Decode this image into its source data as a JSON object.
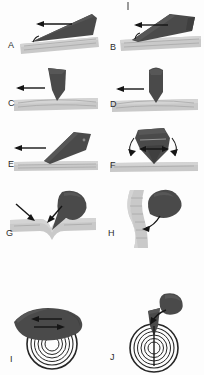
{
  "figure": {
    "background_color": "#fdfdfd",
    "tool_color": "#4a4a4a",
    "substrate_color": "#c9c9c9",
    "arrow_color": "#151515",
    "label_color": "#2b2b2b",
    "columns": 2,
    "rows": 5,
    "top_tick_mark": "I"
  },
  "panels": [
    {
      "label": "A",
      "row": 1,
      "column": 1,
      "tool_shape": "thin-elongated-wedge",
      "tool_orientation": "shallow-oblique",
      "substrate": "horizontal-striated-band",
      "arrow": {
        "type": "straight",
        "direction": "left",
        "count": 1
      },
      "contact": "tangential-edge-contact",
      "secondary_marker": "small-curved-tick-at-contact"
    },
    {
      "label": "B",
      "row": 1,
      "column": 2,
      "tool_shape": "broad-flat-blade",
      "tool_orientation": "shallow-oblique",
      "substrate": "horizontal-striated-band",
      "arrow": {
        "type": "straight",
        "direction": "left",
        "count": 1
      },
      "contact": "flat-face-contact",
      "secondary_marker": "small-curved-tick-at-contact"
    },
    {
      "label": "C",
      "row": 2,
      "column": 1,
      "tool_shape": "curved-leaf-blade",
      "tool_orientation": "near-vertical-tilted",
      "substrate": "horizontal-striated-band-with-furrow",
      "arrow": {
        "type": "straight",
        "direction": "left",
        "count": 1
      },
      "contact": "point-tip-contact",
      "secondary_marker": "none"
    },
    {
      "label": "D",
      "row": 2,
      "column": 2,
      "tool_shape": "rounded-tipped-column",
      "tool_orientation": "vertical",
      "substrate": "horizontal-striated-band-with-furrow",
      "arrow": {
        "type": "straight",
        "direction": "left",
        "count": 1
      },
      "contact": "point-tip-contact",
      "secondary_marker": "none"
    },
    {
      "label": "E",
      "row": 3,
      "column": 1,
      "tool_shape": "tapered-pointed-wedge",
      "tool_orientation": "oblique-45-degree",
      "substrate": "horizontal-striated-band",
      "arrow": {
        "type": "straight",
        "direction": "left",
        "count": 1
      },
      "contact": "pointed-tip-contact",
      "secondary_marker": "none"
    },
    {
      "label": "F",
      "row": 3,
      "column": 2,
      "tool_shape": "broad-faceted-head-with-point",
      "tool_orientation": "vertical",
      "substrate": "horizontal-striated-band",
      "arrow": {
        "type": "rotational-pair-plus-bidirectional",
        "direction": "both",
        "count": 3
      },
      "contact": "pivoting-point-contact",
      "secondary_marker": "curved-arrows-both-sides"
    },
    {
      "label": "G",
      "row": 4,
      "column": 1,
      "tool_shape": "teardrop-blob",
      "tool_orientation": "oblique-above",
      "substrate": "striated-band-with-deep-notch",
      "arrow": {
        "type": "converging-pair",
        "direction": "down-right",
        "count": 2
      },
      "contact": "indentation-notch",
      "secondary_marker": "two-arrows-converge-on-notch"
    },
    {
      "label": "H",
      "row": 4,
      "column": 2,
      "tool_shape": "teardrop-blob",
      "tool_orientation": "oblique-right",
      "substrate": "vertical-striated-band",
      "arrow": {
        "type": "curved",
        "direction": "down-left",
        "count": 1
      },
      "contact": "lateral-sweep",
      "secondary_marker": "curved-sweeping-arrow"
    },
    {
      "label": "I",
      "row": 5,
      "column": 1,
      "tool_shape": "flat-lobed-mass",
      "tool_orientation": "horizontal-overlying",
      "substrate": "concentric-ring-structure",
      "arrow": {
        "type": "bidirectional-pair",
        "direction": "left-and-right",
        "count": 2
      },
      "contact": "surface-shear-over-rings",
      "secondary_marker": "opposed-horizontal-arrows"
    },
    {
      "label": "J",
      "row": 5,
      "column": 2,
      "tool_shape": "narrow-pointed-blade",
      "tool_orientation": "vertical-penetrating",
      "substrate": "concentric-ring-structure",
      "arrow": {
        "type": "curved",
        "direction": "down-left",
        "count": 1
      },
      "contact": "axial-penetration-through-rings",
      "secondary_marker": "detached-blob-above-with-curved-arrow"
    }
  ]
}
